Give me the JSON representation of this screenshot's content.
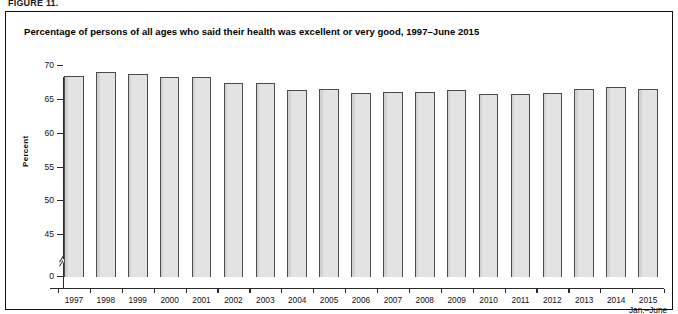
{
  "figure": {
    "label": "FIGURE 11.",
    "title": "Percentage of persons of all ages who said their health was excellent or very good, 1997–June 2015"
  },
  "axes": {
    "y_title": "Percent",
    "y_ticks": [
      "0",
      "45",
      "50",
      "55",
      "60",
      "65",
      "70"
    ],
    "x_last_sublabel": "Jan.–June"
  },
  "colors": {
    "bar_fill": "#e3e3e3",
    "bar_edge": "#4b4b4b",
    "axis": "#2b2b2b",
    "frame": "#101010",
    "text": "#101010",
    "background": "#ffffff"
  },
  "chart_data": {
    "type": "bar",
    "title": "Percentage of persons of all ages who said their health was excellent or very good, 1997–June 2015",
    "xlabel": "",
    "ylabel": "Percent",
    "ylim": [
      0,
      70
    ],
    "y_axis_break": {
      "from": 0,
      "to": 43.5,
      "shown": true
    },
    "yticks": [
      0,
      45,
      50,
      55,
      60,
      65,
      70
    ],
    "grid": false,
    "legend": null,
    "categories": [
      "1997",
      "1998",
      "1999",
      "2000",
      "2001",
      "2002",
      "2003",
      "2004",
      "2005",
      "2006",
      "2007",
      "2008",
      "2009",
      "2010",
      "2011",
      "2012",
      "2013",
      "2014",
      "2015"
    ],
    "values": [
      68.5,
      69.0,
      68.7,
      68.3,
      68.4,
      67.4,
      67.4,
      66.4,
      66.5,
      66.0,
      66.1,
      66.1,
      66.4,
      65.8,
      65.8,
      66.0,
      66.6,
      66.9,
      66.6
    ],
    "annotations": [
      "2015 data cover Jan.–June"
    ]
  }
}
